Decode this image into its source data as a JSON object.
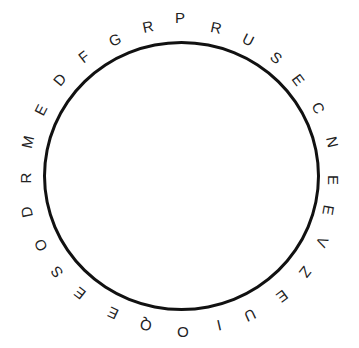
{
  "figure": {
    "type": "circular-letter-ring",
    "ring_color": "#111111",
    "letter_color": "#222222",
    "letters": [
      {
        "char": "P",
        "x": 180,
        "y": 18,
        "rot": 0
      },
      {
        "char": "R",
        "x": 216,
        "y": 28,
        "rot": 12
      },
      {
        "char": "U",
        "x": 248,
        "y": 40,
        "rot": 27
      },
      {
        "char": "S",
        "x": 276,
        "y": 58,
        "rot": 40
      },
      {
        "char": "E",
        "x": 298,
        "y": 80,
        "rot": 53
      },
      {
        "char": "C",
        "x": 318,
        "y": 108,
        "rot": 65
      },
      {
        "char": "N",
        "x": 332,
        "y": 142,
        "rot": 78
      },
      {
        "char": "E",
        "x": 333,
        "y": 180,
        "rot": 90
      },
      {
        "char": "E",
        "x": 328,
        "y": 210,
        "rot": 100
      },
      {
        "char": "V",
        "x": 322,
        "y": 242,
        "rot": 115
      },
      {
        "char": "Z",
        "x": 305,
        "y": 272,
        "rot": 128
      },
      {
        "char": "E",
        "x": 282,
        "y": 296,
        "rot": 143
      },
      {
        "char": "U",
        "x": 250,
        "y": 315,
        "rot": 155
      },
      {
        "char": "I",
        "x": 219,
        "y": 325,
        "rot": 167
      },
      {
        "char": "O",
        "x": 183,
        "y": 332,
        "rot": 180
      },
      {
        "char": "Q",
        "x": 146,
        "y": 325,
        "rot": 190
      },
      {
        "char": "E",
        "x": 113,
        "y": 313,
        "rot": 205
      },
      {
        "char": "E",
        "x": 80,
        "y": 293,
        "rot": 218
      },
      {
        "char": "S",
        "x": 57,
        "y": 272,
        "rot": 232
      },
      {
        "char": "O",
        "x": 41,
        "y": 245,
        "rot": 245
      },
      {
        "char": "D",
        "x": 27,
        "y": 212,
        "rot": 258
      },
      {
        "char": "R",
        "x": 26,
        "y": 178,
        "rot": 270
      },
      {
        "char": "M",
        "x": 28,
        "y": 142,
        "rot": 283
      },
      {
        "char": "E",
        "x": 41,
        "y": 110,
        "rot": 297
      },
      {
        "char": "D",
        "x": 60,
        "y": 80,
        "rot": 310
      },
      {
        "char": "F",
        "x": 84,
        "y": 57,
        "rot": 322
      },
      {
        "char": "G",
        "x": 115,
        "y": 40,
        "rot": 336
      },
      {
        "char": "R",
        "x": 148,
        "y": 27,
        "rot": 348
      }
    ]
  }
}
